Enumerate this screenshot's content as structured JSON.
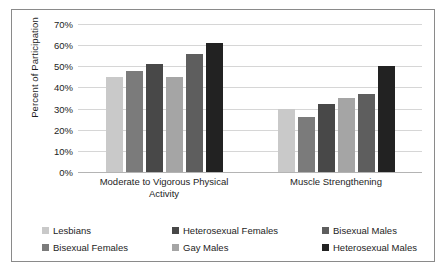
{
  "chart_data": {
    "type": "bar",
    "title": "",
    "xlabel": "",
    "ylabel": "Percent of Participation",
    "ylim": [
      0,
      70
    ],
    "grid": true,
    "legend_position": "bottom",
    "categories": [
      "Moderate to Vigorous Physical Activity",
      "Muscle Strengthening"
    ],
    "y_ticks": [
      "0%",
      "10%",
      "20%",
      "30%",
      "40%",
      "50%",
      "60%",
      "70%"
    ],
    "y_tick_values": [
      0,
      10,
      20,
      30,
      40,
      50,
      60,
      70
    ],
    "series": [
      {
        "name": "Lesbians",
        "color": "#c9c9c9",
        "values": [
          45,
          30
        ]
      },
      {
        "name": "Bisexual Females",
        "color": "#7b7b7b",
        "values": [
          48,
          26
        ]
      },
      {
        "name": "Heterosexual Females",
        "color": "#484848",
        "values": [
          51,
          32
        ]
      },
      {
        "name": "Gay Males",
        "color": "#a5a5a5",
        "values": [
          45,
          35
        ]
      },
      {
        "name": "Bisexual Males",
        "color": "#5e5e5e",
        "values": [
          56,
          37
        ]
      },
      {
        "name": "Heterosexual Males",
        "color": "#222222",
        "values": [
          61,
          50
        ]
      }
    ]
  },
  "legend": {
    "items": [
      {
        "label": "Lesbians"
      },
      {
        "label": "Bisexual Females"
      },
      {
        "label": "Heterosexual Females"
      },
      {
        "label": "Gay Males"
      },
      {
        "label": "Bisexual Males"
      },
      {
        "label": "Heterosexual Males"
      }
    ]
  }
}
